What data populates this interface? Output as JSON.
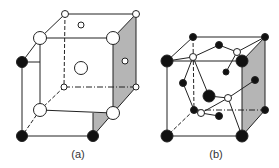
{
  "figure": {
    "panels": [
      {
        "id": "a",
        "label": "(a)",
        "description": "Cubic unit cell with open (white) and filled (black) atoms; right face shaded"
      },
      {
        "id": "b",
        "label": "(b)",
        "description": "Cubic unit cell with black atoms and white atoms connected by bonds; right face shaded"
      }
    ],
    "colors": {
      "line": "#222222",
      "shade": "#b5b5b5",
      "atom_filled": "#111111",
      "atom_open": "#ffffff"
    }
  }
}
